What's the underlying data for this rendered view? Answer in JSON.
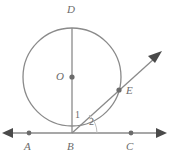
{
  "figure": {
    "background_color": "#ffffff",
    "stroke_color": "#8a8a8a",
    "label_color": "#6b6b6b",
    "point_color": "#6b6b6b",
    "width": 169,
    "height": 158,
    "circle": {
      "center_label": "O",
      "center_x": 72,
      "center_y": 77,
      "radius": 49
    },
    "points": [
      {
        "id": "D",
        "label": "D",
        "x": 72,
        "y": 28,
        "label_x": 67,
        "label_y": 4,
        "has_dot": false
      },
      {
        "id": "O",
        "label": "O",
        "x": 72,
        "y": 77,
        "label_x": 56,
        "label_y": 71,
        "has_dot": true
      },
      {
        "id": "E",
        "label": "E",
        "x": 119,
        "y": 90,
        "label_x": 126,
        "label_y": 90,
        "has_dot": true
      },
      {
        "id": "B",
        "label": "B",
        "x": 72,
        "y": 133,
        "label_x": 67,
        "label_y": 141,
        "has_dot": false
      },
      {
        "id": "A",
        "label": "A",
        "x": 29,
        "y": 133,
        "label_x": 24,
        "label_y": 141,
        "has_dot": true
      },
      {
        "id": "C",
        "label": "C",
        "x": 131,
        "y": 133,
        "label_x": 126,
        "label_y": 141,
        "has_dot": true
      }
    ],
    "segments": [
      {
        "id": "diameter-DB",
        "from": "D",
        "to": "B",
        "description": "vertical diameter from D to B"
      },
      {
        "id": "line-AC",
        "from": "A",
        "to": "C",
        "description": "horizontal tangent line through B with arrows at both ends"
      },
      {
        "id": "ray-BE",
        "from": "B",
        "to": "E",
        "description": "ray from B through E with arrowhead beyond circle"
      }
    ],
    "angles": [
      {
        "id": "angle-1",
        "label": "1",
        "label_x": 75,
        "label_y": 110,
        "description": "angle between diameter DB and ray BE"
      },
      {
        "id": "angle-2",
        "label": "2",
        "label_x": 89,
        "label_y": 117,
        "description": "angle between ray BE and tangent line toward C"
      }
    ]
  }
}
